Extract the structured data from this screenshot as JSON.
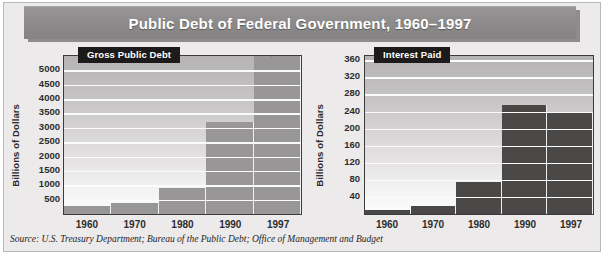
{
  "title": "Public Debt of Federal Government, 1960–1997",
  "source": "Source: U.S. Treasury Department; Bureau of the Public Debt; Office of Management and  Budget",
  "colors": {
    "banner": "#8b8989",
    "panel_background": "#eceaea",
    "left_bar": "#989696",
    "right_bar": "#4a4747",
    "tag_background": "#1c1a1a",
    "gridline": "#fbfbfb",
    "axis": "#3b3b3b"
  },
  "chart_data": [
    {
      "type": "bar",
      "title": "Gross Public Debt",
      "xlabel": "",
      "ylabel": "Billions of Dollars",
      "categories": [
        "1960",
        "1970",
        "1980",
        "1990",
        "1997"
      ],
      "values": [
        286,
        381,
        909,
        3207,
        5499
      ],
      "value_labels": [
        "",
        "",
        "",
        "",
        "5,499"
      ],
      "ylim": [
        0,
        5499
      ],
      "yticks": [
        5000,
        4500,
        4000,
        3500,
        3000,
        2500,
        2000,
        1500,
        1000,
        500
      ],
      "grid": true,
      "legend": "none",
      "bar_color": "#989696"
    },
    {
      "type": "bar",
      "title": "Interest Paid",
      "xlabel": "",
      "ylabel": "Billions of Dollars",
      "categories": [
        "1960",
        "1970",
        "1980",
        "1990",
        "1997"
      ],
      "values": [
        9,
        19,
        75,
        255,
        238
      ],
      "value_labels": [
        "",
        "",
        "",
        "",
        ""
      ],
      "ylim": [
        0,
        370
      ],
      "yticks": [
        360,
        320,
        280,
        240,
        200,
        160,
        120,
        80,
        40
      ],
      "grid": true,
      "legend": "none",
      "bar_color": "#4a4747"
    }
  ]
}
